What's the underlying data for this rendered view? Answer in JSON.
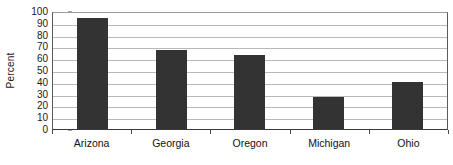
{
  "chart_data": {
    "type": "bar",
    "title": "",
    "xlabel": "",
    "ylabel": "Percent",
    "ylim": [
      0,
      100
    ],
    "ytick_step": 10,
    "yticks": [
      100,
      90,
      80,
      70,
      60,
      50,
      40,
      30,
      20,
      10,
      0
    ],
    "grid": true,
    "legend": "none",
    "categories": [
      "Arizona",
      "Georgia",
      "Oregon",
      "Michigan",
      "Ohio"
    ],
    "values": [
      94,
      67,
      63,
      27,
      40
    ],
    "bar_color": "#333333",
    "gridline_color": "#b8b8b8",
    "axis_color": "#3a3a3a",
    "background_color": "#ffffff"
  }
}
